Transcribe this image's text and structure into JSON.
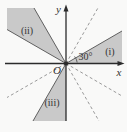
{
  "figure": {
    "axis_labels": {
      "x": "x",
      "y": "y",
      "origin": "O"
    },
    "angle_label": "30°",
    "angle_value_deg": 30,
    "regions": [
      {
        "label": "(i)",
        "start_deg": 0,
        "end_deg": 30
      },
      {
        "label": "(ii)",
        "start_deg": 120,
        "end_deg": 150
      },
      {
        "label": "(iii)",
        "start_deg": 240,
        "end_deg": 270
      }
    ],
    "dashed_rays_deg": [
      60,
      210,
      300,
      330
    ],
    "colors": {
      "background": "#f9f9f8",
      "region_fill": "#c9c9c9",
      "axis": "#2b2b2b",
      "boundary": "#606060",
      "dashed": "#9a9a9a",
      "text": "#333333"
    }
  }
}
